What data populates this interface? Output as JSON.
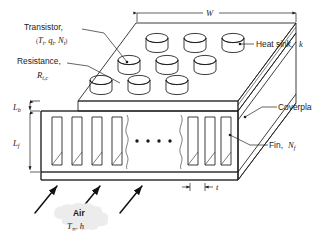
{
  "figure": {
    "background_color": "#ffffff",
    "labels": {
      "transistor": "Transistor,",
      "transistor_params_open": "(",
      "transistor_T": "T",
      "transistor_T_sub": "t",
      "transistor_comma1": ",",
      "transistor_q": "q",
      "transistor_q_sub": "t",
      "transistor_comma2": ",",
      "transistor_N": "N",
      "transistor_N_sub": "t",
      "transistor_params_close": ")",
      "resistance": "Resistance,",
      "resistance_R": "R",
      "resistance_R_sub": "t,c",
      "heat_sink": "Heat sink,",
      "heat_sink_k": "k",
      "coverplate": "Coverplate",
      "fin": "Fin,",
      "fin_N": "N",
      "fin_N_sub": "f",
      "air": "Air",
      "air_T": "T",
      "air_T_sub": "∞",
      "air_comma": ",",
      "air_h": "h",
      "width_W": "W",
      "base_thickness_L": "L",
      "base_thickness_sub": "b",
      "fin_length_L": "L",
      "fin_length_sub": "f",
      "fin_thickness_t": "t",
      "ellipsis": "• • • •"
    },
    "colors": {
      "top_face": "#c9c9c9",
      "front_face": "#dcdcdc",
      "side_face": "#b4b4b4",
      "fin_face": "#a9a9a9",
      "cylinder_top": "#d8d8d8",
      "cylinder_side": "#bdbdbd",
      "outline": "#1a1a1a",
      "text": "#1a1a1a",
      "callout_fill": "#ececec"
    },
    "geometry": {
      "transistor_rows": 3,
      "transistor_columns": 4,
      "fins_drawn_left": 4,
      "fins_drawn_right": 4,
      "airflow_arrows": 3
    }
  }
}
